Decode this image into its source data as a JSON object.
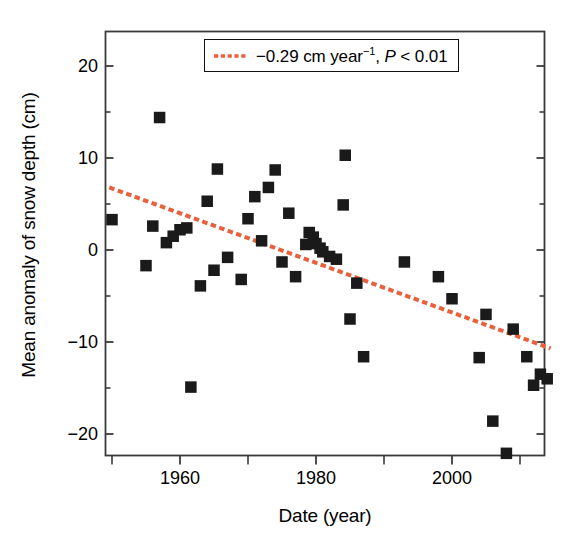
{
  "chart_data": {
    "type": "scatter",
    "title": "",
    "xlabel": "Date (year)",
    "ylabel": "Mean anomaly of snow depth (cm)",
    "xlim": [
      1949,
      2015
    ],
    "ylim": [
      -25.5,
      24.5
    ],
    "xticks": [
      1960,
      1980,
      2000
    ],
    "xtick_labels": [
      "1960",
      "1980",
      "2000"
    ],
    "xminor_ticks": [
      1950,
      1970,
      1990,
      2010
    ],
    "yticks": [
      20,
      10,
      0,
      -10,
      -20
    ],
    "ytick_labels": [
      "20",
      "10",
      "0",
      "−10",
      "−20"
    ],
    "grid": false,
    "legend_position": "top-center",
    "marker": "filled-square",
    "marker_color": "#1a1a1a",
    "series": [
      {
        "name": "Mean anomaly of snow depth",
        "type": "scatter",
        "points": [
          [
            1950,
            3.3
          ],
          [
            1955,
            -1.7
          ],
          [
            1956,
            2.6
          ],
          [
            1957,
            14.4
          ],
          [
            1958,
            0.8
          ],
          [
            1959,
            1.5
          ],
          [
            1960,
            2.2
          ],
          [
            1961,
            2.4
          ],
          [
            1961.6,
            -14.9
          ],
          [
            1963,
            -3.9
          ],
          [
            1964,
            5.3
          ],
          [
            1965,
            -2.2
          ],
          [
            1965.5,
            8.8
          ],
          [
            1967,
            -0.8
          ],
          [
            1969,
            -3.2
          ],
          [
            1970,
            3.4
          ],
          [
            1971,
            5.8
          ],
          [
            1972,
            1.0
          ],
          [
            1973,
            6.8
          ],
          [
            1974,
            8.7
          ],
          [
            1975,
            -1.3
          ],
          [
            1976,
            4.0
          ],
          [
            1977,
            -2.9
          ],
          [
            1978.5,
            0.6
          ],
          [
            1979,
            1.9
          ],
          [
            1979.6,
            1.4
          ],
          [
            1980,
            0.7
          ],
          [
            1980.6,
            0.2
          ],
          [
            1981,
            -0.2
          ],
          [
            1982,
            -0.7
          ],
          [
            1983,
            -1.0
          ],
          [
            1984,
            4.9
          ],
          [
            1984.3,
            10.3
          ],
          [
            1985,
            -7.5
          ],
          [
            1986,
            -3.6
          ],
          [
            1987,
            -11.6
          ],
          [
            1993,
            -1.3
          ],
          [
            1998,
            -2.9
          ],
          [
            2000,
            -5.3
          ],
          [
            2004,
            -11.7
          ],
          [
            2005,
            -7.0
          ],
          [
            2006,
            -18.6
          ],
          [
            2008,
            -22.1
          ],
          [
            2009,
            -8.6
          ],
          [
            2011,
            -11.6
          ],
          [
            2012,
            -14.7
          ],
          [
            2013,
            -13.5
          ],
          [
            2014,
            -14.0
          ]
        ]
      }
    ],
    "trend": {
      "label_slope": "−0.29 cm year",
      "label_slope_exponent": "−1",
      "label_separator": ", ",
      "label_pvalue_italic": "P",
      "label_pvalue_rest": " < 0.01",
      "slope_per_year": -0.29,
      "color": "#e8603c",
      "style": "dashed",
      "x_start": 1949.6,
      "y_start": 6.8,
      "x_end": 2014.5,
      "y_end": -10.7
    }
  },
  "legend": {
    "full_text": "−0.29 cm year⁻¹, P < 0.01",
    "swatch_name": "dashed-trend-line-swatch"
  },
  "axes": {
    "frame_color": "#3a3a3a",
    "tick_color": "#3a3a3a"
  }
}
